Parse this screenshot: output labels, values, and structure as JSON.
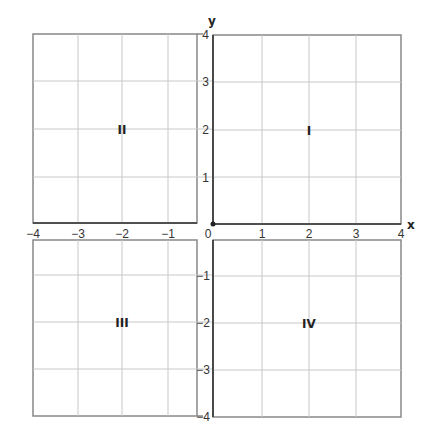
{
  "diagram": {
    "axes": {
      "x_label": "x",
      "y_label": "y",
      "x_ticks": [
        "−4",
        "−3",
        "−2",
        "−1",
        "0",
        "1",
        "2",
        "3",
        "4"
      ],
      "y_ticks_positive": [
        "4",
        "3",
        "2",
        "1"
      ],
      "y_ticks_negative": [
        "−1",
        "−2",
        "−3",
        "−4"
      ],
      "x_range": [
        -4,
        4
      ],
      "y_range": [
        -4,
        4
      ]
    },
    "quadrants": [
      {
        "label": "I",
        "x": 2,
        "y": 2
      },
      {
        "label": "II",
        "x": -2,
        "y": 2
      },
      {
        "label": "III",
        "x": -2,
        "y": -2
      },
      {
        "label": "IV",
        "x": 2,
        "y": -2
      }
    ],
    "origin_label": "0",
    "colors": {
      "grid": "#c8c8c8",
      "border": "#888888",
      "axis": "#333333"
    }
  }
}
